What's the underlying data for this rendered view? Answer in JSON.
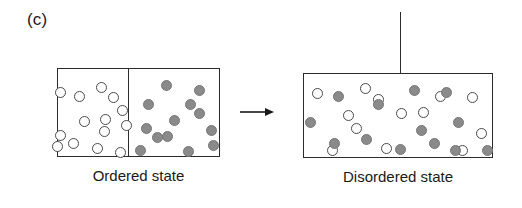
{
  "figure": {
    "panel_label": "(c)",
    "arrow_icon": "right-arrow-icon",
    "width": 522,
    "height": 208,
    "background_color": "#ffffff"
  },
  "colors": {
    "outline": "#2b2b2b",
    "open_particle_fill": "#ffffff",
    "open_particle_stroke": "#4a4a4a",
    "filled_particle_fill": "#8a8a8a",
    "filled_particle_stroke": "#777777",
    "text": "#1a1a1a"
  },
  "ordered_state": {
    "caption": "Ordered state",
    "box": {
      "x": 57,
      "y": 68,
      "width": 163,
      "height": 89
    },
    "divider": {
      "x": 128,
      "y": 68,
      "height": 89
    },
    "left_compartment_species": "open",
    "right_compartment_species": "filled",
    "open_particle_count": 14,
    "filled_particle_count": 13,
    "open_particles": [
      {
        "cx": 79,
        "cy": 96,
        "r": 5.5
      },
      {
        "cx": 101,
        "cy": 87,
        "r": 5.5
      },
      {
        "cx": 113,
        "cy": 97,
        "r": 5.5
      },
      {
        "cx": 60,
        "cy": 92,
        "r": 5.5
      },
      {
        "cx": 122,
        "cy": 110,
        "r": 5.5
      },
      {
        "cx": 84,
        "cy": 121,
        "r": 5.5
      },
      {
        "cx": 105,
        "cy": 119,
        "r": 5.5
      },
      {
        "cx": 104,
        "cy": 131,
        "r": 5.5
      },
      {
        "cx": 60,
        "cy": 135,
        "r": 5.5
      },
      {
        "cx": 73,
        "cy": 143,
        "r": 5.5
      },
      {
        "cx": 97,
        "cy": 148,
        "r": 5.5
      },
      {
        "cx": 120,
        "cy": 152,
        "r": 5.5
      },
      {
        "cx": 57,
        "cy": 146,
        "r": 5.5
      },
      {
        "cx": 126,
        "cy": 125,
        "r": 5.5
      }
    ],
    "filled_particles": [
      {
        "cx": 166,
        "cy": 85,
        "r": 5.5
      },
      {
        "cx": 148,
        "cy": 104,
        "r": 5.5
      },
      {
        "cx": 190,
        "cy": 104,
        "r": 5.5
      },
      {
        "cx": 199,
        "cy": 113,
        "r": 5.5
      },
      {
        "cx": 174,
        "cy": 120,
        "r": 5.5
      },
      {
        "cx": 146,
        "cy": 128,
        "r": 5.5
      },
      {
        "cx": 157,
        "cy": 137,
        "r": 5.5
      },
      {
        "cx": 211,
        "cy": 130,
        "r": 5.5
      },
      {
        "cx": 140,
        "cy": 150,
        "r": 5.5
      },
      {
        "cx": 188,
        "cy": 151,
        "r": 5.5
      },
      {
        "cx": 213,
        "cy": 145,
        "r": 5.5
      },
      {
        "cx": 167,
        "cy": 136,
        "r": 5.5
      },
      {
        "cx": 199,
        "cy": 90,
        "r": 5.5
      }
    ]
  },
  "disordered_state": {
    "caption": "Disordered state",
    "box": {
      "x": 303,
      "y": 73,
      "width": 190,
      "height": 85
    },
    "stem_line": {
      "x": 400,
      "y": 12,
      "height": 88
    },
    "open_particle_count": 13,
    "filled_particle_count": 13,
    "open_particles": [
      {
        "cx": 317,
        "cy": 93,
        "r": 5.5
      },
      {
        "cx": 365,
        "cy": 88,
        "r": 5.5
      },
      {
        "cx": 472,
        "cy": 97,
        "r": 5.5
      },
      {
        "cx": 348,
        "cy": 115,
        "r": 5.5
      },
      {
        "cx": 401,
        "cy": 113,
        "r": 5.5
      },
      {
        "cx": 423,
        "cy": 112,
        "r": 5.5
      },
      {
        "cx": 356,
        "cy": 128,
        "r": 5.5
      },
      {
        "cx": 481,
        "cy": 133,
        "r": 5.5
      },
      {
        "cx": 386,
        "cy": 148,
        "r": 5.5
      },
      {
        "cx": 462,
        "cy": 150,
        "r": 5.5
      },
      {
        "cx": 332,
        "cy": 150,
        "r": 5.5
      },
      {
        "cx": 440,
        "cy": 96,
        "r": 5.5
      },
      {
        "cx": 378,
        "cy": 99,
        "r": 5.5
      }
    ],
    "filled_particles": [
      {
        "cx": 338,
        "cy": 96,
        "r": 5.5
      },
      {
        "cx": 414,
        "cy": 90,
        "r": 5.5
      },
      {
        "cx": 446,
        "cy": 92,
        "r": 5.5
      },
      {
        "cx": 378,
        "cy": 104,
        "r": 5.5
      },
      {
        "cx": 310,
        "cy": 122,
        "r": 5.5
      },
      {
        "cx": 458,
        "cy": 122,
        "r": 5.5
      },
      {
        "cx": 334,
        "cy": 143,
        "r": 5.5
      },
      {
        "cx": 400,
        "cy": 149,
        "r": 5.5
      },
      {
        "cx": 434,
        "cy": 143,
        "r": 5.5
      },
      {
        "cx": 455,
        "cy": 150,
        "r": 5.5
      },
      {
        "cx": 487,
        "cy": 150,
        "r": 5.5
      },
      {
        "cx": 366,
        "cy": 139,
        "r": 5.5
      },
      {
        "cx": 421,
        "cy": 130,
        "r": 5.5
      }
    ]
  }
}
